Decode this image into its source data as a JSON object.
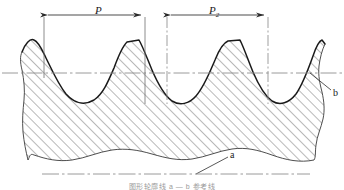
{
  "figure": {
    "caption": "图形轮廓线  a — b 参考线",
    "colors": {
      "profile_outline": "#1a1a1a",
      "hatch": "#5a5a5a",
      "dimension_line": "#3a3a3a",
      "center_line": "#8f8f8f",
      "extension_line": "#6e6e6e",
      "leader_line": "#4a4a4a",
      "background": "#ffffff"
    }
  },
  "dimensions": [
    {
      "id": "pitch-1",
      "label": "P",
      "subscript": "",
      "label_x": 95,
      "label_y": 6,
      "start_x": 44,
      "end_x": 145,
      "line_y": 15
    },
    {
      "id": "pitch-2",
      "label": "P",
      "subscript": "2",
      "label_x": 209,
      "label_y": 6,
      "start_x": 167,
      "end_x": 268,
      "line_y": 15
    }
  ],
  "reference_marks": [
    {
      "id": "mean-line-callout",
      "label": "b",
      "label_x": 333,
      "label_y": 92,
      "leader_from_x": 310,
      "leader_from_y": 73,
      "leader_to_x": 331,
      "leader_to_y": 90,
      "description": "mean line of the profile"
    },
    {
      "id": "datum-line-callout",
      "label": "a",
      "label_x": 230,
      "label_y": 155,
      "leader_from_x": 196,
      "leader_from_y": 174,
      "leader_to_x": 228,
      "leader_to_y": 158,
      "description": "datum reference line"
    }
  ],
  "lines": {
    "mean_line": {
      "id": "horizontal-center-line",
      "y": 73,
      "x1": 2,
      "x2": 342,
      "style": "dash-dot"
    },
    "datum_line": {
      "id": "bottom-datum-line",
      "y": 174,
      "x1": 42,
      "x2": 310,
      "style": "dash-dot"
    },
    "extension_lines": [
      {
        "id": "ext-1",
        "x": 44,
        "y1": 17,
        "y2": 78,
        "style": "solid"
      },
      {
        "id": "ext-2",
        "x": 145,
        "y1": 17,
        "y2": 104,
        "style": "solid"
      },
      {
        "id": "ext-3",
        "x": 167,
        "y1": 17,
        "y2": 104,
        "style": "dash-dot"
      },
      {
        "id": "ext-4",
        "x": 268,
        "y1": 17,
        "y2": 104,
        "style": "dash-dot"
      }
    ]
  },
  "profile": {
    "type": "periodic-trapezoidal-peaks",
    "peak_y": 40,
    "valley_y": 104,
    "mean_y": 73,
    "period_px": 101,
    "peaks_visible": 3,
    "valleys_visible": 3
  }
}
